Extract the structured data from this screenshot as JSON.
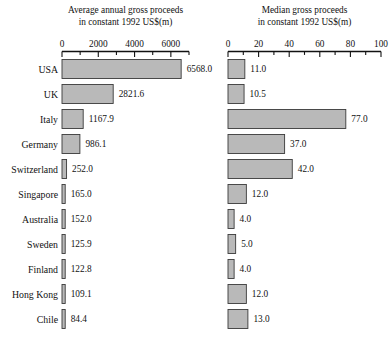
{
  "chart_data": {
    "type": "bar",
    "orientation": "horizontal",
    "panels": [
      {
        "id": "left",
        "title_line1": "Average annual gross proceeds",
        "title_line2": "in constant 1992 US$(m)",
        "xlim": [
          0,
          7000
        ],
        "major_ticks": [
          0,
          2000,
          4000,
          6000
        ],
        "minor_tick_step": 1000,
        "tick_labels": [
          "0",
          "2000",
          "4000",
          "6000"
        ],
        "grid": false,
        "values": [
          6568.0,
          2821.6,
          1167.9,
          986.1,
          252.0,
          165.0,
          152.0,
          125.9,
          122.8,
          109.1,
          84.4
        ],
        "value_labels": [
          "6568.0",
          "2821.6",
          "1167.9",
          "986.1",
          "252.0",
          "165.0",
          "152.0",
          "125.9",
          "122.8",
          "109.1",
          "84.4"
        ]
      },
      {
        "id": "right",
        "title_line1": "Median gross proceeds",
        "title_line2": "in constant 1992 US$(m)",
        "xlim": [
          0,
          100
        ],
        "major_ticks": [
          0,
          20,
          40,
          60,
          80,
          100
        ],
        "minor_tick_step": 10,
        "tick_labels": [
          "0",
          "20",
          "40",
          "60",
          "80",
          "100"
        ],
        "grid": false,
        "values": [
          11.0,
          10.5,
          77.0,
          37.0,
          42.0,
          12.0,
          4.0,
          5.0,
          4.0,
          12.0,
          13.0
        ],
        "value_labels": [
          "11.0",
          "10.5",
          "77.0",
          "37.0",
          "42.0",
          "12.0",
          "4.0",
          "5.0",
          "4.0",
          "12.0",
          "13.0"
        ]
      }
    ],
    "categories": [
      "USA",
      "UK",
      "Italy",
      "Germany",
      "Switzerland",
      "Singapore",
      "Australia",
      "Sweden",
      "Finland",
      "Hong Kong",
      "Chile"
    ],
    "xlabel": "",
    "ylabel": "",
    "bar_color": "#b9b9b9",
    "bar_edge_color": "#3a3a3a"
  }
}
